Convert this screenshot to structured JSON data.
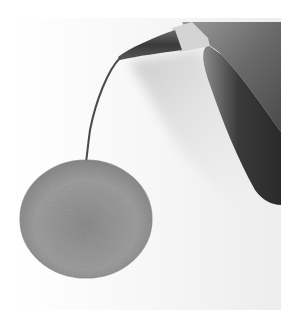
{
  "image": {
    "subject": "hand drawing a textured circle with a pencil",
    "description": "A hand holding a pencil draws a thin curved line down to a gray textured filled circle on white paper",
    "elements": [
      "paper",
      "hand",
      "pencil",
      "stem-line",
      "textured-circle"
    ],
    "colors": {
      "background": "#ffffff",
      "paper": "#f4f4f4",
      "circle_fill": "#9a9a9a",
      "circle_dark": "#7e7e7e",
      "hand_light": "#8a8a8a",
      "hand_dark": "#2e2e2e",
      "pencil_lead": "#3a3a3a",
      "pencil_wood": "#d8d8d8",
      "shadow": "#bdbdbd"
    }
  }
}
